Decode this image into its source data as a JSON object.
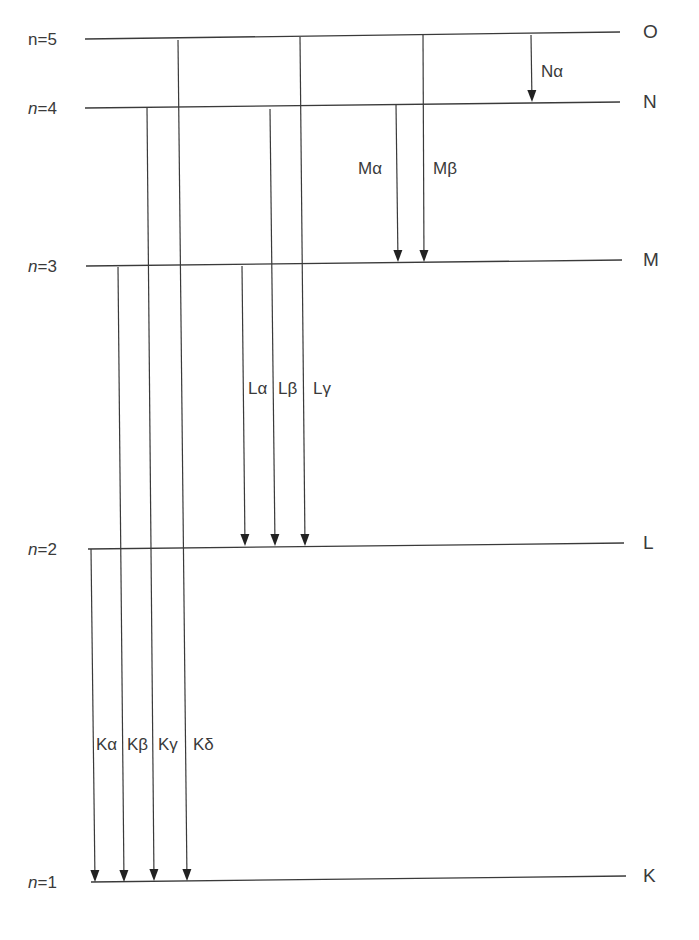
{
  "diagram": {
    "levels": [
      {
        "n_label": "n=5",
        "n_italic": false,
        "shell": "O",
        "y_left": 39,
        "y_right": 32,
        "x_start": 85,
        "x_end": 620
      },
      {
        "n_label": "n=4",
        "n_italic": true,
        "shell": "N",
        "y_left": 108,
        "y_right": 102,
        "x_start": 85,
        "x_end": 620
      },
      {
        "n_label": "n=3",
        "n_italic": true,
        "shell": "M",
        "y_left": 266,
        "y_right": 260,
        "x_start": 86,
        "x_end": 622
      },
      {
        "n_label": "n=2",
        "n_italic": true,
        "shell": "L",
        "y_left": 549,
        "y_right": 543,
        "x_start": 88,
        "x_end": 624
      },
      {
        "n_label": "n=1",
        "n_italic": true,
        "shell": "K",
        "y_left": 882,
        "y_right": 876,
        "x_start": 91,
        "x_end": 626
      }
    ],
    "transitions": [
      {
        "label": "Nα",
        "from": "O",
        "to": "N",
        "x_top": 531,
        "y_top": 35,
        "x_bot": 532,
        "y_bot": 102,
        "label_x": 541,
        "label_y": 77
      },
      {
        "label": "Mα",
        "from": "N",
        "to": "M",
        "x_top": 396,
        "y_top": 104,
        "x_bot": 398,
        "y_bot": 262,
        "label_x": 358,
        "label_y": 174
      },
      {
        "label": "Mβ",
        "from": "O",
        "to": "M",
        "x_top": 423,
        "y_top": 35,
        "x_bot": 424,
        "y_bot": 262,
        "label_x": 433,
        "label_y": 174
      },
      {
        "label": "Lα",
        "from": "M",
        "to": "L",
        "x_top": 242,
        "y_top": 266,
        "x_bot": 245,
        "y_bot": 546,
        "label_x": 248,
        "label_y": 394
      },
      {
        "label": "Lβ",
        "from": "N",
        "to": "L",
        "x_top": 270,
        "y_top": 109,
        "x_bot": 275,
        "y_bot": 546,
        "label_x": 278,
        "label_y": 394
      },
      {
        "label": "Lγ",
        "from": "O",
        "to": "L",
        "x_top": 300,
        "y_top": 37,
        "x_bot": 305,
        "y_bot": 546,
        "label_x": 313,
        "label_y": 394
      },
      {
        "label": "Kα",
        "from": "L",
        "to": "K",
        "x_top": 91,
        "y_top": 549,
        "x_bot": 95,
        "y_bot": 882,
        "label_x": 96,
        "label_y": 750
      },
      {
        "label": "Kβ",
        "from": "M",
        "to": "K",
        "x_top": 118,
        "y_top": 267,
        "x_bot": 124,
        "y_bot": 882,
        "label_x": 127,
        "label_y": 750
      },
      {
        "label": "Kγ",
        "from": "N",
        "to": "K",
        "x_top": 147,
        "y_top": 108,
        "x_bot": 154,
        "y_bot": 881,
        "label_x": 158,
        "label_y": 750
      },
      {
        "label": "Kδ",
        "from": "O",
        "to": "K",
        "x_top": 178,
        "y_top": 40,
        "x_bot": 187,
        "y_bot": 881,
        "label_x": 193,
        "label_y": 750
      }
    ],
    "colors": {
      "line": "#3a3a3a",
      "arrow": "#222222",
      "text": "#3a3a3a",
      "background": "#ffffff"
    }
  }
}
